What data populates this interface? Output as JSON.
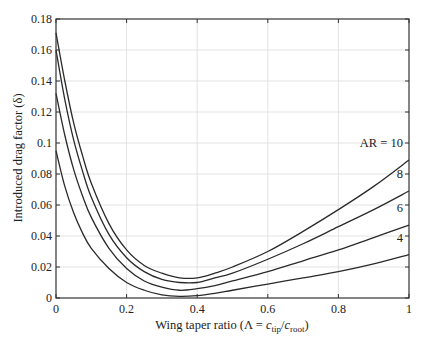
{
  "chart_data": {
    "type": "line",
    "title": "",
    "xlabel": "Wing taper ratio (Λ = c_tip/c_root)",
    "xlabel_parts": {
      "pre": "Wing taper ratio (Λ = ",
      "c1": "c",
      "s1": "tip",
      "slash": "/",
      "c2": "c",
      "s2": "root",
      "post": ")"
    },
    "ylabel": "Introduced drag factor (δ)",
    "xlim": [
      0,
      1
    ],
    "ylim": [
      0,
      0.18
    ],
    "xticks": [
      0,
      0.2,
      0.4,
      0.6,
      0.8,
      1
    ],
    "xtick_labels": [
      "0",
      "0.2",
      "0.4",
      "0.6",
      "0.8",
      "1"
    ],
    "yticks": [
      0,
      0.02,
      0.04,
      0.06,
      0.08,
      0.1,
      0.12,
      0.14,
      0.16,
      0.18
    ],
    "ytick_labels": [
      "0",
      "0.02",
      "0.04",
      "0.06",
      "0.08",
      "0.1",
      "0.12",
      "0.14",
      "0.16",
      "0.18"
    ],
    "grid": true,
    "x": [
      0,
      0.025,
      0.05,
      0.075,
      0.1,
      0.15,
      0.2,
      0.25,
      0.3,
      0.35,
      0.4,
      0.45,
      0.5,
      0.6,
      0.7,
      0.8,
      0.9,
      1.0
    ],
    "series": [
      {
        "name": "AR = 4",
        "label": "4",
        "values": [
          0.095,
          0.072,
          0.055,
          0.042,
          0.032,
          0.019,
          0.01,
          0.005,
          0.002,
          0.001,
          0.0015,
          0.003,
          0.005,
          0.009,
          0.013,
          0.017,
          0.022,
          0.028
        ]
      },
      {
        "name": "AR = 6",
        "label": "6",
        "values": [
          0.132,
          0.105,
          0.083,
          0.066,
          0.052,
          0.032,
          0.019,
          0.011,
          0.007,
          0.005,
          0.006,
          0.008,
          0.011,
          0.017,
          0.024,
          0.031,
          0.039,
          0.047
        ]
      },
      {
        "name": "AR = 8",
        "label": "8",
        "values": [
          0.16,
          0.128,
          0.102,
          0.082,
          0.065,
          0.041,
          0.026,
          0.017,
          0.012,
          0.01,
          0.01,
          0.013,
          0.016,
          0.025,
          0.035,
          0.046,
          0.057,
          0.069
        ]
      },
      {
        "name": "AR = 10",
        "label": "AR = 10",
        "values": [
          0.171,
          0.14,
          0.113,
          0.092,
          0.074,
          0.048,
          0.031,
          0.021,
          0.016,
          0.013,
          0.013,
          0.016,
          0.02,
          0.03,
          0.043,
          0.057,
          0.072,
          0.089
        ]
      }
    ],
    "annotations": [
      "AR = 10",
      "8",
      "6",
      "4"
    ]
  }
}
